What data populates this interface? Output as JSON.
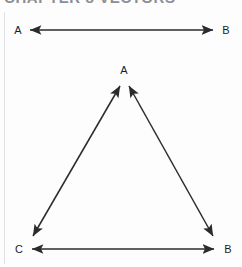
{
  "figure": {
    "scan_header_partial_text": "CHAPTER 8  VECTORS",
    "background_color": "#fdfdfd",
    "stroke_color": "#2b2b2f",
    "label_color": "#1d1d1f",
    "gutter_rule_color": "#e3e3e5"
  },
  "top_diagram": {
    "name": "segment-ab",
    "start_label": "A",
    "end_label": "B",
    "arrowheads": "both",
    "start_point": [
      30,
      30
    ],
    "end_point": [
      213,
      30
    ]
  },
  "triangle_diagram": {
    "name": "triangle-abc",
    "vertices": [
      {
        "id": "A",
        "label": "A",
        "x": 124,
        "y": 82,
        "label_x": 124,
        "label_y": 71
      },
      {
        "id": "C",
        "label": "C",
        "x": 30,
        "y": 241,
        "label_x": 19,
        "label_y": 253
      },
      {
        "id": "B",
        "label": "B",
        "x": 216,
        "y": 241,
        "label_x": 228,
        "label_y": 253
      }
    ],
    "edges": [
      {
        "name": "edge-ca",
        "from": "C",
        "to": "A",
        "arrowheads": "both"
      },
      {
        "name": "edge-ab",
        "from": "A",
        "to": "B",
        "arrowheads": "both"
      },
      {
        "name": "edge-cb",
        "from": "C",
        "to": "B",
        "arrowheads": "both"
      }
    ]
  }
}
